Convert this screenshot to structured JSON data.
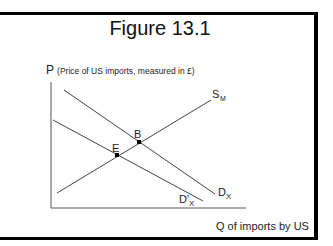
{
  "figure": {
    "title": "Figure 13.1",
    "y_axis_symbol": "P",
    "y_axis_label": "(Price of US imports, measured in £)",
    "x_axis_label": "Q of imports by US"
  },
  "curves": {
    "supply": {
      "label": "S",
      "sub": "M"
    },
    "demand": {
      "label": "D",
      "sub": "X"
    },
    "demand_shifted": {
      "label": "D'",
      "sub": "X"
    }
  },
  "points": {
    "b": {
      "label": "B"
    },
    "e": {
      "label": "E"
    }
  },
  "colors": {
    "line": "#444444",
    "border": "#000000",
    "text": "#222222"
  }
}
